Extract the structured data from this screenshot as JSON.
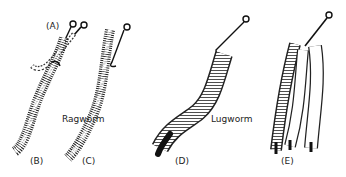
{
  "figure": {
    "panels": [
      {
        "id": "A",
        "label": "(A)"
      },
      {
        "id": "B",
        "label": "(B)"
      },
      {
        "id": "C",
        "label": "(C)"
      },
      {
        "id": "D",
        "label": "(D)"
      },
      {
        "id": "E",
        "label": "(E)"
      }
    ],
    "names": {
      "ragworm": "Ragworm",
      "lugworm": "Lugworm"
    },
    "colors": {
      "ink": "#1a1a1a",
      "background": "#ffffff"
    }
  }
}
